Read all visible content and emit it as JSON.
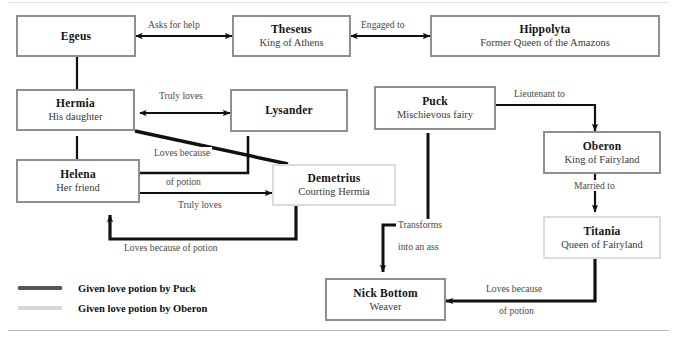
{
  "diagram": {
    "title_partial": "",
    "nodes": [
      {
        "id": "egeus",
        "name": "Egeus",
        "role": "",
        "border": "dark"
      },
      {
        "id": "theseus",
        "name": "Theseus",
        "role": "King of Athens",
        "border": "dark"
      },
      {
        "id": "hippolyta",
        "name": "Hippolyta",
        "role": "Former Queen of the Amazons",
        "border": "dark"
      },
      {
        "id": "hermia",
        "name": "Hermia",
        "role": "His daughter",
        "border": "dark"
      },
      {
        "id": "lysander",
        "name": "Lysander",
        "role": "",
        "border": "dark"
      },
      {
        "id": "puck",
        "name": "Puck",
        "role": "Mischievous fairy",
        "border": "dark"
      },
      {
        "id": "oberon",
        "name": "Oberon",
        "role": "King of Fairyland",
        "border": "dark"
      },
      {
        "id": "helena",
        "name": "Helena",
        "role": "Her friend",
        "border": "dark"
      },
      {
        "id": "demetrius",
        "name": "Demetrius",
        "role": "Courting Hermia",
        "border": "light"
      },
      {
        "id": "titania",
        "name": "Titania",
        "role": "Queen of Fairyland",
        "border": "light"
      },
      {
        "id": "nickbottom",
        "name": "Nick Bottom",
        "role": "Weaver",
        "border": "dark"
      }
    ],
    "edge_labels": [
      {
        "id": "asks-for-help",
        "text": "Asks for help"
      },
      {
        "id": "engaged-to",
        "text": "Engaged to"
      },
      {
        "id": "truly-loves-hermia",
        "text": "Truly loves"
      },
      {
        "id": "lieutenant-to",
        "text": "Lieutenant to"
      },
      {
        "id": "loves-because-1",
        "text": "Loves because"
      },
      {
        "id": "of-potion-1",
        "text": "of potion"
      },
      {
        "id": "married-to",
        "text": "Married to"
      },
      {
        "id": "truly-loves-helena",
        "text": "Truly loves"
      },
      {
        "id": "transforms",
        "text": "Transforms"
      },
      {
        "id": "into-an-ass",
        "text": "into an ass"
      },
      {
        "id": "loves-potion-long",
        "text": "Loves because of potion"
      },
      {
        "id": "loves-because-2",
        "text": "Loves because"
      },
      {
        "id": "of-potion-2",
        "text": "of potion"
      }
    ]
  },
  "legend": {
    "items": [
      {
        "label": "Given love potion by Puck",
        "color": "#585858"
      },
      {
        "label": "Given love potion by Oberon",
        "color": "#d8d8d8"
      }
    ]
  },
  "colors": {
    "edge": "#111111",
    "border_dark": "#8e8e8e",
    "border_light": "#dcdcdc",
    "text": "#262626"
  }
}
